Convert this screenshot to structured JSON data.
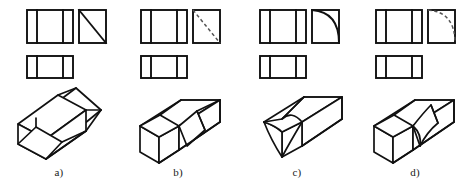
{
  "figure": {
    "type": "engineering-drawing",
    "panel_count": 4,
    "background_color": "#ffffff",
    "line_color": "#111111",
    "hidden_line_color": "#555555"
  },
  "panels": [
    {
      "id": "a",
      "label": "a)",
      "front_view": {
        "name": "front-view",
        "shape": "rectangle",
        "divider_count": 2,
        "divider_positions": [
          0.22,
          0.78
        ]
      },
      "side_view": {
        "name": "side-view",
        "shape": "square",
        "feature": "diagonal",
        "feature_style": "solid",
        "diagonal_direction": "top-left-to-bottom-right"
      },
      "top_view": {
        "name": "top-view",
        "shape": "rectangle",
        "divider_count": 2,
        "divider_positions": [
          0.22,
          0.78
        ]
      },
      "pictorial": {
        "name": "isometric-pictorial",
        "feature": "angled-wedge-cut",
        "feature_visibility": "visible",
        "orientation": "rotated"
      }
    },
    {
      "id": "b",
      "label": "b)",
      "front_view": {
        "name": "front-view",
        "shape": "rectangle",
        "divider_count": 2,
        "divider_positions": [
          0.22,
          0.78
        ]
      },
      "side_view": {
        "name": "side-view",
        "shape": "square",
        "feature": "diagonal",
        "feature_style": "dashed",
        "diagonal_direction": "top-left-to-bottom-right"
      },
      "top_view": {
        "name": "top-view",
        "shape": "rectangle",
        "divider_count": 2,
        "divider_positions": [
          0.22,
          0.78
        ]
      },
      "pictorial": {
        "name": "isometric-pictorial",
        "feature": "angled-wedge-cut",
        "feature_visibility": "hidden",
        "orientation": "standard"
      }
    },
    {
      "id": "c",
      "label": "c)",
      "front_view": {
        "name": "front-view",
        "shape": "rectangle",
        "divider_count": 2,
        "divider_positions": [
          0.22,
          0.78
        ]
      },
      "side_view": {
        "name": "side-view",
        "shape": "square",
        "feature": "arc",
        "feature_style": "solid",
        "arc_direction": "top-left-to-bottom-right-convex"
      },
      "top_view": {
        "name": "top-view",
        "shape": "rectangle",
        "divider_count": 2,
        "divider_positions": [
          0.22,
          0.78
        ]
      },
      "pictorial": {
        "name": "isometric-pictorial",
        "feature": "curved-cylindrical-cut",
        "feature_visibility": "visible",
        "orientation": "standard"
      }
    },
    {
      "id": "d",
      "label": "d)",
      "front_view": {
        "name": "front-view",
        "shape": "rectangle",
        "divider_count": 2,
        "divider_positions": [
          0.22,
          0.78
        ]
      },
      "side_view": {
        "name": "side-view",
        "shape": "square",
        "feature": "arc",
        "feature_style": "dashed",
        "arc_direction": "top-left-to-bottom-right-convex"
      },
      "top_view": {
        "name": "top-view",
        "shape": "rectangle",
        "divider_count": 2,
        "divider_positions": [
          0.22,
          0.78
        ]
      },
      "pictorial": {
        "name": "isometric-pictorial",
        "feature": "curved-cylindrical-cut",
        "feature_visibility": "hidden",
        "orientation": "standard"
      }
    }
  ]
}
